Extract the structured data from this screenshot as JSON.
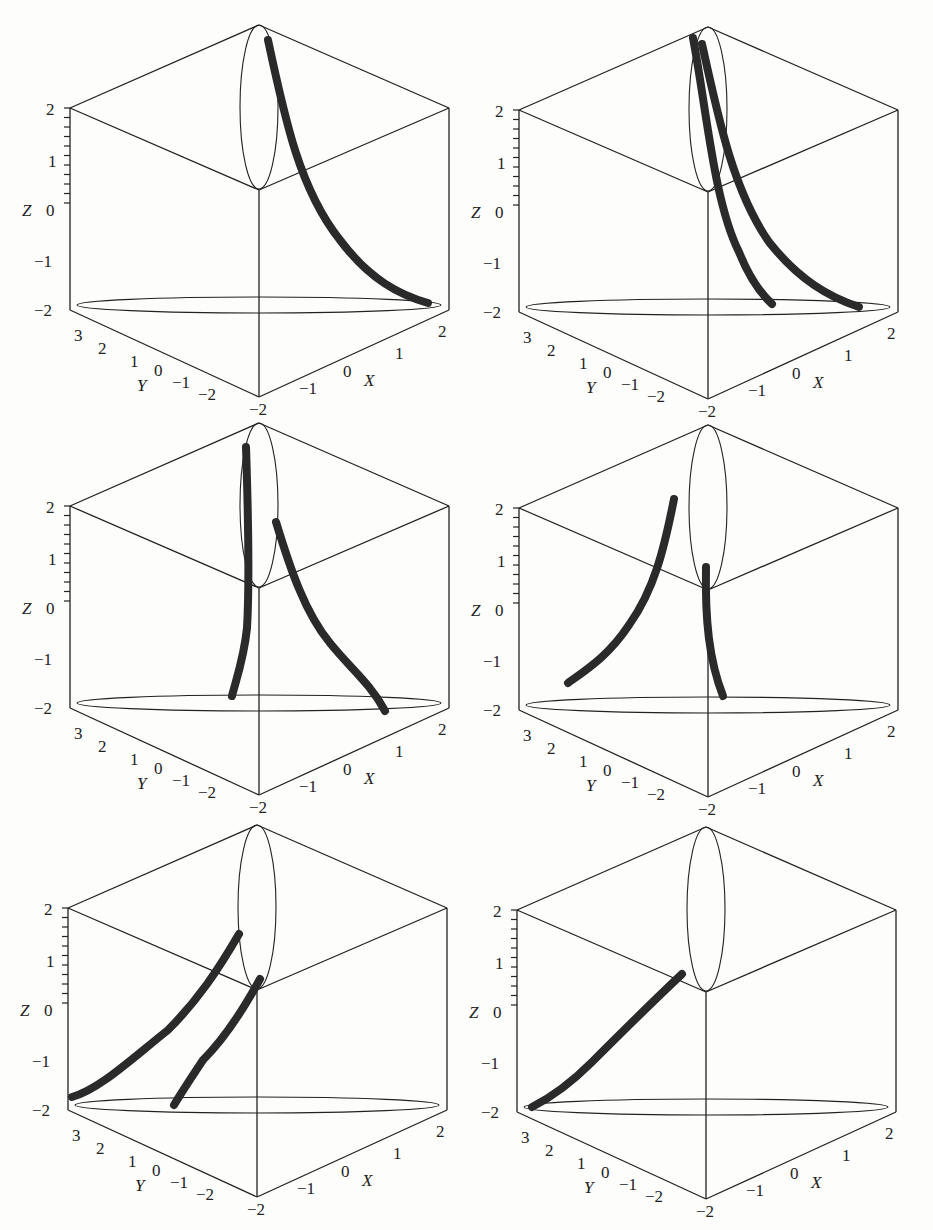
{
  "figure": {
    "panels": [
      {
        "id": "panel-1",
        "position": "top-left",
        "origin": [
          0,
          0
        ],
        "axes": {
          "z": {
            "name": "Z",
            "ticks": [
              "2",
              "1",
              "0",
              "−1",
              "−2"
            ]
          },
          "y": {
            "name": "Y",
            "ticks": [
              "3",
              "2",
              "1",
              "0",
              "−1",
              "−2"
            ]
          },
          "x": {
            "name": "X",
            "ticks": [
              "−2",
              "−1",
              "0",
              "1",
              "2"
            ]
          }
        },
        "curves": 1
      },
      {
        "id": "panel-2",
        "position": "top-right",
        "origin": [
          449,
          2
        ],
        "axes": {
          "z": {
            "name": "Z",
            "ticks": [
              "2",
              "1",
              "0",
              "−1",
              "−2"
            ]
          },
          "y": {
            "name": "Y",
            "ticks": [
              "3",
              "2",
              "1",
              "0",
              "−1",
              "−2"
            ]
          },
          "x": {
            "name": "X",
            "ticks": [
              "−2",
              "−1",
              "0",
              "1",
              "2"
            ]
          }
        },
        "curves": 2
      },
      {
        "id": "panel-3",
        "position": "middle-left",
        "origin": [
          0,
          398
        ],
        "axes": {
          "z": {
            "name": "Z",
            "ticks": [
              "2",
              "1",
              "0",
              "−1",
              "−2"
            ]
          },
          "y": {
            "name": "Y",
            "ticks": [
              "3",
              "2",
              "1",
              "0",
              "−1",
              "−2"
            ]
          },
          "x": {
            "name": "X",
            "ticks": [
              "−2",
              "−1",
              "0",
              "1",
              "2"
            ]
          }
        },
        "top_tick": "−2",
        "curves": 2
      },
      {
        "id": "panel-4",
        "position": "middle-right",
        "origin": [
          449,
          400
        ],
        "axes": {
          "z": {
            "name": "Z",
            "ticks": [
              "2",
              "1",
              "0",
              "−1",
              "−2"
            ]
          },
          "y": {
            "name": "Y",
            "ticks": [
              "3",
              "2",
              "1",
              "0",
              "−1",
              "−2"
            ]
          },
          "x": {
            "name": "X",
            "ticks": [
              "−2",
              "−1",
              "0",
              "1",
              "2"
            ]
          }
        },
        "top_tick": "−2",
        "curves": 2
      },
      {
        "id": "panel-5",
        "position": "bottom-left",
        "origin": [
          -2,
          800
        ],
        "axes": {
          "z": {
            "name": "Z",
            "ticks": [
              "2",
              "1",
              "0",
              "−1",
              "−2"
            ]
          },
          "y": {
            "name": "Y",
            "ticks": [
              "3",
              "2",
              "1",
              "0",
              "−1",
              "−2"
            ]
          },
          "x": {
            "name": "X",
            "ticks": [
              "−2",
              "−1",
              "0",
              "1",
              "2"
            ]
          }
        },
        "top_tick": "−2",
        "curves": 2
      },
      {
        "id": "panel-6",
        "position": "bottom-right",
        "origin": [
          447,
          802
        ],
        "axes": {
          "z": {
            "name": "Z",
            "ticks": [
              "2",
              "1",
              "0",
              "−1",
              "−2"
            ]
          },
          "y": {
            "name": "Y",
            "ticks": [
              "3",
              "2",
              "1",
              "0",
              "−1",
              "−2"
            ]
          },
          "x": {
            "name": "X",
            "ticks": [
              "−2",
              "−1",
              "0",
              "1",
              "2"
            ]
          }
        },
        "top_tick": "−2",
        "curves": 1
      }
    ]
  },
  "colors": {
    "line": "#222222",
    "curve": "#2a2a2a",
    "paper": "#fdfdfc"
  }
}
